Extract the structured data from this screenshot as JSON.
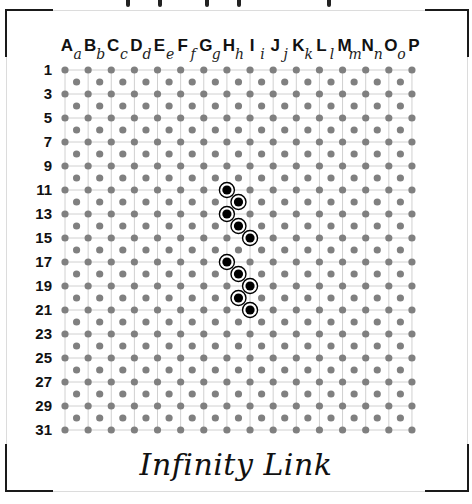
{
  "board": {
    "title": "Infinity Link",
    "columns_upper": [
      "A",
      "B",
      "C",
      "D",
      "E",
      "F",
      "G",
      "H",
      "I",
      "J",
      "K",
      "L",
      "M",
      "N",
      "O",
      "P"
    ],
    "columns_lower": [
      "a",
      "b",
      "c",
      "d",
      "e",
      "f",
      "g",
      "h",
      "i",
      "j",
      "k",
      "l",
      "m",
      "n",
      "o"
    ],
    "row_labels": [
      "1",
      "3",
      "5",
      "7",
      "9",
      "11",
      "13",
      "15",
      "17",
      "19",
      "21",
      "23",
      "25",
      "27",
      "29",
      "31"
    ],
    "rows_total": 31,
    "colors": {
      "dot": "#808080",
      "grid_line": "#d0d0d0",
      "stone": "#000000",
      "frame": "#1a1a1a"
    },
    "marked_points": [
      {
        "col": "H",
        "row": 11
      },
      {
        "col": "h",
        "row": 12
      },
      {
        "col": "H",
        "row": 13
      },
      {
        "col": "h",
        "row": 14
      },
      {
        "col": "I",
        "row": 15
      },
      {
        "col": "H",
        "row": 17
      },
      {
        "col": "h",
        "row": 18
      },
      {
        "col": "I",
        "row": 19
      },
      {
        "col": "h",
        "row": 20
      },
      {
        "col": "I",
        "row": 21
      }
    ]
  }
}
